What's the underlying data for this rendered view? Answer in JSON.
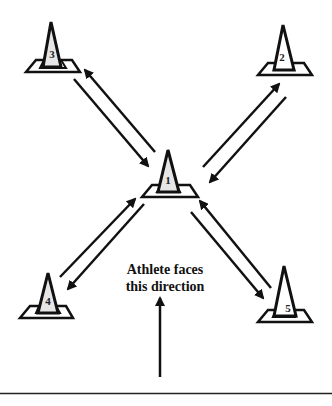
{
  "diagram": {
    "caption": {
      "line1": "Athlete faces",
      "line2": "this direction"
    },
    "cones": [
      {
        "id": "1",
        "label": "1",
        "position": "center"
      },
      {
        "id": "2",
        "label": "2",
        "position": "top-right"
      },
      {
        "id": "3",
        "label": "3",
        "position": "top-left"
      },
      {
        "id": "4",
        "label": "4",
        "position": "bottom-left"
      },
      {
        "id": "5",
        "label": "5",
        "position": "bottom-right"
      }
    ],
    "paths": [
      {
        "from": "1",
        "to": "2",
        "bidirectional": true
      },
      {
        "from": "1",
        "to": "3",
        "bidirectional": true
      },
      {
        "from": "1",
        "to": "4",
        "bidirectional": true
      },
      {
        "from": "1",
        "to": "5",
        "bidirectional": true
      }
    ],
    "colors": {
      "stroke": "#111111",
      "cone_fill": "#e6e6e6",
      "background": "#ffffff"
    }
  }
}
